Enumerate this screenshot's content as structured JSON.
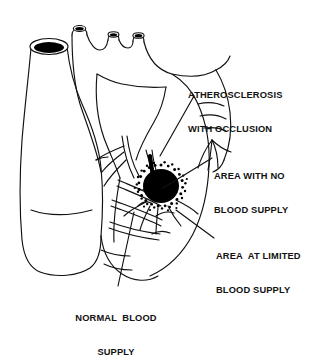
{
  "figure": {
    "background_color": "#ffffff",
    "ink_color": "#111111",
    "infarct_color": "#000000"
  },
  "labels": {
    "atherosclerosis": {
      "line1": "ATHEROSCLEROSIS",
      "line2": "WITH OCCLUSION"
    },
    "no_blood_supply": {
      "line1": "AREA WITH NO",
      "line2": "BLOOD SUPPLY"
    },
    "limited_blood_supply": {
      "line1": "AREA  AT LIMITED",
      "line2": "BLOOD SUPPLY"
    },
    "normal_blood_supply": {
      "line1": "NORMAL  BLOOD",
      "line2": "SUPPLY"
    }
  },
  "anatomy": {
    "superior_vena_cava": "superior vena cava with open dark lumen",
    "aortic_arch": "aortic arch",
    "arch_branches": [
      "brachiocephalic trunk stub",
      "left common carotid artery stub",
      "left subclavian artery stub"
    ],
    "pulmonary_trunk": "pulmonary trunk",
    "right_ventricle": "right ventricle",
    "left_ventricle": "left ventricle",
    "apex": "cardiac apex",
    "coronary_arteries": "left anterior descending and branches",
    "occlusion_site": "narrowed darkened coronary segment above infarct",
    "infarct": "solid black necrotic zone",
    "penumbra": "stippled border of limited perfusion"
  }
}
